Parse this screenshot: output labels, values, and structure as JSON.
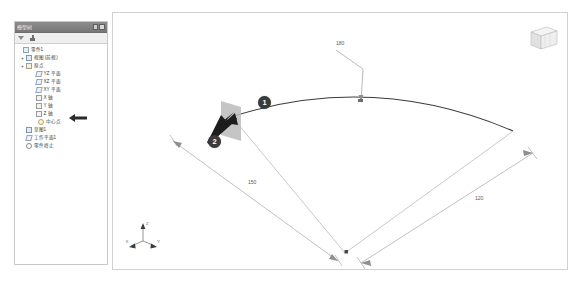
{
  "app": {
    "kind": "cad-3d-sketch-viewport"
  },
  "tree_panel": {
    "title": "模型树",
    "toolbar": {
      "filter_icon": "filter-icon",
      "tree_icon": "tree-display-icon"
    },
    "titlebar_controls": {
      "dock_icon": "dock-icon",
      "close_icon": "close-icon"
    },
    "items": [
      {
        "label": "零件1",
        "icon": "document-icon",
        "depth": 0,
        "expander": ""
      },
      {
        "label": "视图 (前视)",
        "icon": "plane-icon",
        "depth": 1,
        "expander": "+"
      },
      {
        "label": "原点",
        "icon": "origin-icon",
        "depth": 1,
        "expander": "+"
      },
      {
        "label": "YZ 平面",
        "icon": "plane-icon",
        "depth": 2,
        "expander": ""
      },
      {
        "label": "XZ 平面",
        "icon": "plane-icon",
        "depth": 2,
        "expander": ""
      },
      {
        "label": "XY 平面",
        "icon": "plane-icon",
        "depth": 2,
        "expander": ""
      },
      {
        "label": "X 轴",
        "icon": "axis-icon",
        "depth": 2,
        "expander": ""
      },
      {
        "label": "Y 轴",
        "icon": "axis-icon",
        "depth": 2,
        "expander": ""
      },
      {
        "label": "Z 轴",
        "icon": "axis-icon",
        "depth": 2,
        "expander": ""
      },
      {
        "label": "中心点",
        "icon": "point-icon",
        "depth": 2,
        "expander": ""
      },
      {
        "label": "草图1",
        "icon": "sketch-icon",
        "depth": 1,
        "expander": ""
      },
      {
        "label": "工作平面1",
        "icon": "plane-icon",
        "depth": 1,
        "expander": ""
      },
      {
        "label": "零件终止",
        "icon": "end-marker-icon",
        "depth": 1,
        "expander": ""
      }
    ],
    "pointer": {
      "icon": "left-arrow-pointer-icon",
      "target_label": "工作平面1"
    }
  },
  "viewport": {
    "view_cube_label": "view-cube",
    "triad": {
      "icon": "coordinate-triad-icon",
      "axes": [
        "X",
        "Y",
        "Z"
      ]
    },
    "dimensions": [
      {
        "name": "arc-height",
        "value": "180"
      },
      {
        "name": "radius-left",
        "value": "150"
      },
      {
        "name": "radius-right",
        "value": "120"
      }
    ],
    "callouts": [
      {
        "number": "1",
        "target": "arc-edge"
      },
      {
        "number": "2",
        "target": "plane-handle"
      }
    ],
    "cursor": "arrow-cursor",
    "origin_point": "origin-point-marker",
    "geometry": {
      "type": "sector-sweep",
      "entities": [
        "arc",
        "radial-line-left",
        "radial-line-right",
        "dimension-line-left",
        "dimension-line-right",
        "leader-line"
      ]
    }
  },
  "colors": {
    "sketch_line": "#3a3a3a",
    "dimension_line": "#9a9a9a",
    "badge_fill": "#3b3b3b",
    "panel_title_bg": "#808080",
    "plane_handle": "#b8b8b8"
  }
}
